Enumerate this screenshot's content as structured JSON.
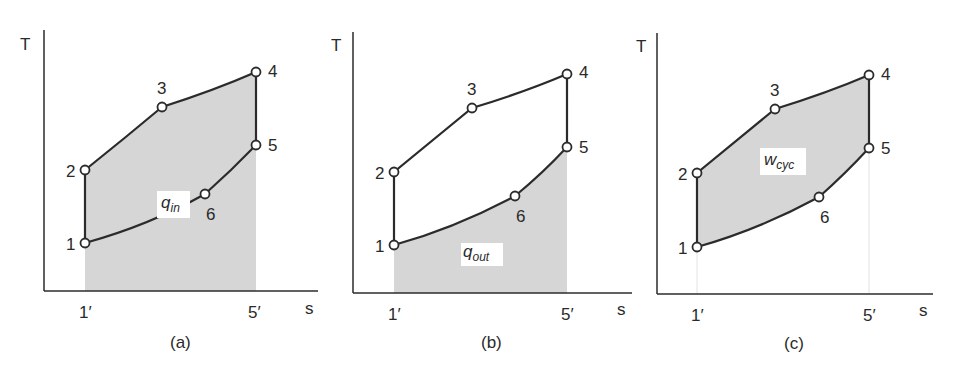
{
  "figure": {
    "panels": [
      {
        "id": "a",
        "caption": "(a)",
        "y_axis_label": "T",
        "x_axis_label": "s",
        "x_ticks": [
          "1′",
          "5′"
        ],
        "area_label": {
          "main": "q",
          "sub": "in"
        },
        "shaded_region": "area under process 1-2-3-4-5 (heat added)",
        "points": [
          "1",
          "2",
          "3",
          "4",
          "5",
          "6"
        ]
      },
      {
        "id": "b",
        "caption": "(b)",
        "y_axis_label": "T",
        "x_axis_label": "s",
        "x_ticks": [
          "1′",
          "5′"
        ],
        "area_label": {
          "main": "q",
          "sub": "out"
        },
        "shaded_region": "area under process 5-6-1 (heat rejected)",
        "points": [
          "1",
          "2",
          "3",
          "4",
          "5",
          "6"
        ]
      },
      {
        "id": "c",
        "caption": "(c)",
        "y_axis_label": "T",
        "x_axis_label": "s",
        "x_ticks": [
          "1′",
          "5′"
        ],
        "area_label": {
          "main": "w",
          "sub": "cyc"
        },
        "shaded_region": "enclosed cycle area (net work)",
        "points": [
          "1",
          "2",
          "3",
          "4",
          "5",
          "6"
        ]
      }
    ],
    "colors": {
      "line": "#2b2b2b",
      "fill": "#d6d6d6",
      "background": "#ffffff"
    }
  }
}
